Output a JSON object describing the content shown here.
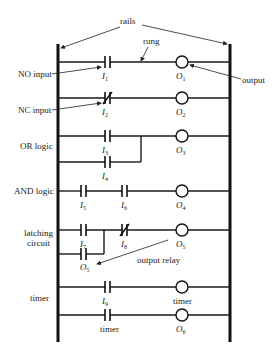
{
  "labels": {
    "rails": "rails",
    "rung": "rung",
    "output": "output",
    "output_relay": "output relay",
    "no_input": "NO input",
    "nc_input": "NC input",
    "or_logic": "OR logic",
    "and_logic": "AND logic",
    "latching_1": "latching",
    "latching_2": "circuit",
    "timer_row": "timer"
  },
  "rungs": [
    {
      "name": "NO input",
      "contacts": [
        {
          "type": "NO",
          "label": "I",
          "sub": "1"
        }
      ],
      "coil": {
        "label": "O",
        "sub": "1"
      }
    },
    {
      "name": "NC input",
      "contacts": [
        {
          "type": "NC",
          "label": "I",
          "sub": "2"
        }
      ],
      "coil": {
        "label": "O",
        "sub": "2"
      }
    },
    {
      "name": "OR logic",
      "contacts": [
        {
          "type": "NO",
          "label": "I",
          "sub": "3"
        },
        {
          "type": "NO",
          "label": "I",
          "sub": "4",
          "parallel": true
        }
      ],
      "coil": {
        "label": "O",
        "sub": "3"
      }
    },
    {
      "name": "AND logic",
      "contacts": [
        {
          "type": "NO",
          "label": "I",
          "sub": "5"
        },
        {
          "type": "NO",
          "label": "I",
          "sub": "6"
        }
      ],
      "coil": {
        "label": "O",
        "sub": "4"
      }
    },
    {
      "name": "latching circuit",
      "contacts": [
        {
          "type": "NO",
          "label": "I",
          "sub": "7"
        },
        {
          "type": "NO",
          "label": "O",
          "sub": "5",
          "parallel": true
        },
        {
          "type": "NC",
          "label": "I",
          "sub": "8"
        }
      ],
      "coil": {
        "label": "O",
        "sub": "5"
      }
    },
    {
      "name": "timer",
      "contacts": [
        {
          "type": "NO",
          "label": "I",
          "sub": "9"
        }
      ],
      "coil": {
        "label": "timer"
      }
    },
    {
      "name": "timer output",
      "contacts": [
        {
          "type": "NO",
          "label": "timer"
        }
      ],
      "coil": {
        "label": "O",
        "sub": "6"
      }
    }
  ],
  "sym": {
    "I": "I",
    "O": "O",
    "s1": "1",
    "s2": "2",
    "s3": "3",
    "s4": "4",
    "s5": "5",
    "s6": "6",
    "s7": "7",
    "s8": "8",
    "s9": "9",
    "timer": "timer"
  }
}
